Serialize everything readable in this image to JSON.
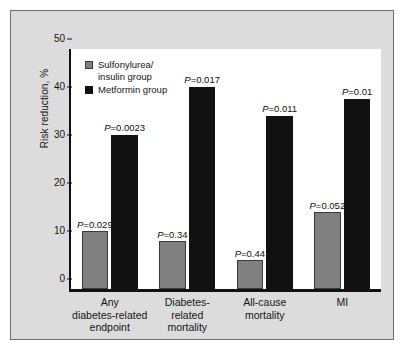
{
  "chart_data": {
    "type": "bar",
    "title": "",
    "xlabel": "",
    "ylabel": "Risk reduction, %",
    "ylim": [
      0,
      50
    ],
    "yticks": [
      0,
      10,
      20,
      30,
      40,
      50
    ],
    "ytick_labels": [
      "0",
      "10",
      "20",
      "30",
      "40",
      "50"
    ],
    "grid": false,
    "legend_position": "top-left",
    "categories": [
      "Any\ndiabetes-related\nendpoint",
      "Diabetes-\nrelated\nmortality",
      "All-cause\nmortality",
      "MI"
    ],
    "series": [
      {
        "name": "Sulfonylurea/\ninsulin group",
        "color": "#808080",
        "values": [
          12,
          10,
          6,
          16
        ],
        "annotations": [
          "P=0.029",
          "P=0.34",
          "P=0.44",
          "P=0.052"
        ]
      },
      {
        "name": "Metformin group",
        "color": "#111111",
        "values": [
          32,
          42,
          36,
          39.5
        ],
        "annotations": [
          "P=0.0023",
          "P=0.017",
          "P=0.011",
          "P=0.01"
        ]
      }
    ]
  },
  "figure": {
    "panel_background": "#dcdcdc",
    "plot_background": "#ffffff",
    "border_color": "#6e6e6e",
    "axis_color": "#111111"
  }
}
